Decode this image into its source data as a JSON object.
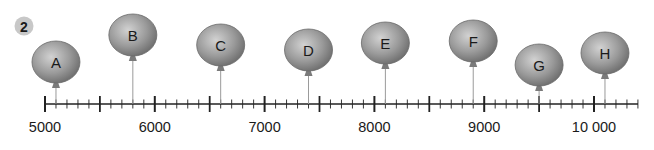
{
  "question_number": "2",
  "number_line": {
    "min": 5000,
    "max": 10400,
    "major_step": 1000,
    "half_step": 500,
    "minor_step": 100,
    "labels": [
      "5000",
      "6000",
      "7000",
      "8000",
      "9000",
      "10 000"
    ]
  },
  "balloons": [
    {
      "letter": "A",
      "value": 5100,
      "height": 62
    },
    {
      "letter": "B",
      "value": 5800,
      "height": 35
    },
    {
      "letter": "C",
      "value": 6600,
      "height": 45
    },
    {
      "letter": "D",
      "value": 7400,
      "height": 50
    },
    {
      "letter": "E",
      "value": 8100,
      "height": 43
    },
    {
      "letter": "F",
      "value": 8900,
      "height": 41
    },
    {
      "letter": "G",
      "value": 9500,
      "height": 65
    },
    {
      "letter": "H",
      "value": 10100,
      "height": 53
    }
  ],
  "colors": {
    "balloon": "#8c8c8c",
    "balloon_light": "#c4c4c4",
    "line": "#222222",
    "badge": "#c8c8c8"
  }
}
